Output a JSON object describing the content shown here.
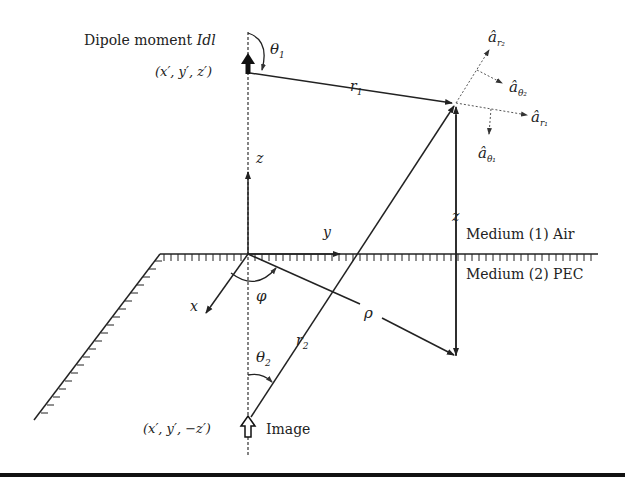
{
  "diagram": {
    "labels": {
      "dipole_moment_prefix": "Dipole moment ",
      "dipole_moment_symbol": "Idl",
      "source_coords": "(x′, y′, z′)",
      "image_coords": "(x′, y′, −z′)",
      "image_label": "Image",
      "theta1": "θ",
      "theta1_sub": "1",
      "theta2": "θ",
      "theta2_sub": "2",
      "r1": "r",
      "r1_sub": "1",
      "r2": "r",
      "r2_sub": "2",
      "z_axis": "z",
      "z_height": "z",
      "y_axis": "y",
      "x_axis": "x",
      "phi": "φ",
      "rho": "ρ",
      "medium1": "Medium (1) Air",
      "medium2": "Medium (2) PEC",
      "a_r2": "â",
      "a_r2_sub": "r₂",
      "a_theta2": "â",
      "a_theta2_sub": "θ₂",
      "a_r1": "â",
      "a_r1_sub": "r₁",
      "a_theta1": "â",
      "a_theta1_sub": "θ₁"
    },
    "colors": {
      "line": "#222222",
      "dashed": "#555555",
      "background": "#ffffff"
    }
  }
}
